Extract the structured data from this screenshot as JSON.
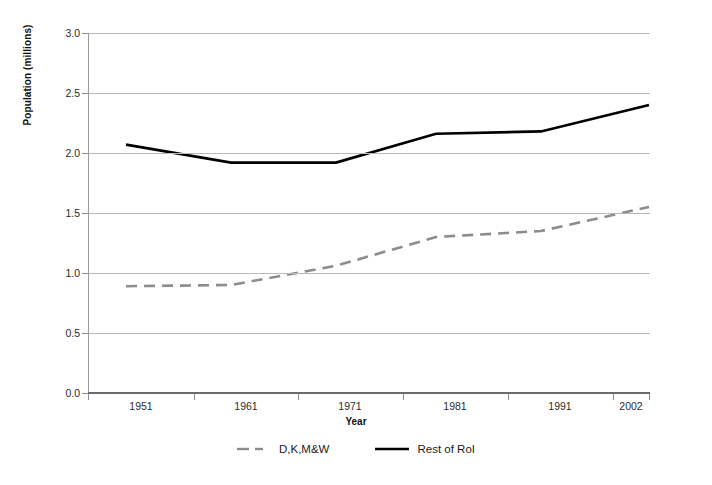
{
  "chart_data": {
    "type": "line",
    "title": "",
    "xlabel": "Year",
    "ylabel": "Population (millions)",
    "categories": [
      "1951",
      "1961",
      "1971",
      "1981",
      "1991",
      "2002"
    ],
    "series": [
      {
        "name": "D,K,M&W",
        "style": "dashed",
        "color": "#8c8c8c",
        "values": [
          0.89,
          0.9,
          1.06,
          1.3,
          1.35,
          1.55
        ]
      },
      {
        "name": "Rest of RoI",
        "style": "solid",
        "color": "#000000",
        "values": [
          2.07,
          1.92,
          1.92,
          2.16,
          2.18,
          2.4
        ]
      }
    ],
    "ylim": [
      0.0,
      3.0
    ],
    "y_ticks": [
      "0.0",
      "0.5",
      "1.0",
      "1.5",
      "2.0",
      "2.5",
      "3.0"
    ],
    "y_tick_values": [
      0.0,
      0.5,
      1.0,
      1.5,
      2.0,
      2.5,
      3.0
    ],
    "grid": "horizontal",
    "legend_position": "bottom"
  },
  "axes": {
    "y_title": "Population (millions)",
    "x_title": "Year"
  },
  "legend": {
    "items": [
      {
        "label": "D,K,M&W",
        "swatch": "dashed-gray-line-icon"
      },
      {
        "label": "Rest of RoI",
        "swatch": "solid-black-line-icon"
      }
    ]
  },
  "colors": {
    "series_dashed": "#8c8c8c",
    "series_solid": "#000000",
    "gridline": "#b9b9b9",
    "axis": "#6a6a6a",
    "text": "#1a1a1a",
    "background": "#ffffff"
  }
}
